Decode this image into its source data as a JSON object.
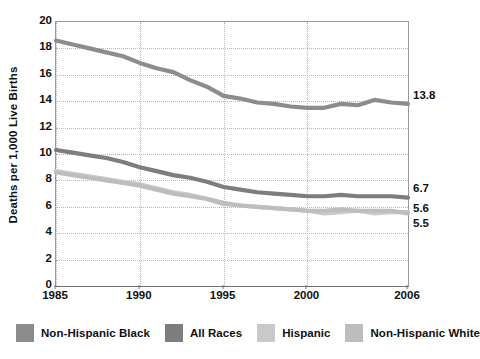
{
  "chart_data": {
    "type": "line",
    "title": "",
    "xlabel": "",
    "ylabel": "Deaths per 1,000 Live Births",
    "xlim": [
      1985,
      2006
    ],
    "ylim": [
      0,
      20
    ],
    "grid": true,
    "legend_position": "bottom",
    "x_ticks": [
      "1985",
      "1990",
      "1995",
      "2000",
      "2006"
    ],
    "x_tick_values": [
      1985,
      1990,
      1995,
      2000,
      2006
    ],
    "y_ticks": [
      "0",
      "2",
      "4",
      "6",
      "8",
      "10",
      "12",
      "14",
      "16",
      "18",
      "20"
    ],
    "y_tick_values": [
      0,
      2,
      4,
      6,
      8,
      10,
      12,
      14,
      16,
      18,
      20
    ],
    "x": [
      1985,
      1986,
      1987,
      1988,
      1989,
      1990,
      1991,
      1992,
      1993,
      1994,
      1995,
      1996,
      1997,
      1998,
      1999,
      2000,
      2001,
      2002,
      2003,
      2004,
      2005,
      2006
    ],
    "series": [
      {
        "name": "Non-Hispanic Black",
        "color": "#8c8c8c",
        "values": [
          18.6,
          18.3,
          18.0,
          17.7,
          17.4,
          16.9,
          16.5,
          16.2,
          15.6,
          15.1,
          14.4,
          14.2,
          13.9,
          13.8,
          13.6,
          13.5,
          13.5,
          13.8,
          13.7,
          14.1,
          13.9,
          13.8
        ],
        "end_label": "13.8"
      },
      {
        "name": "All Races",
        "color": "#7d7d7d",
        "values": [
          10.3,
          10.1,
          9.9,
          9.7,
          9.4,
          9.0,
          8.7,
          8.4,
          8.2,
          7.9,
          7.5,
          7.3,
          7.1,
          7.0,
          6.9,
          6.8,
          6.8,
          6.9,
          6.8,
          6.8,
          6.8,
          6.7
        ],
        "end_label": "6.7"
      },
      {
        "name": "Hispanic",
        "color": "#c9c9c9",
        "values": [
          8.7,
          8.5,
          8.3,
          8.1,
          7.9,
          7.7,
          7.4,
          7.1,
          6.9,
          6.6,
          6.2,
          6.1,
          6.0,
          5.9,
          5.8,
          5.7,
          5.5,
          5.6,
          5.7,
          5.5,
          5.6,
          5.6
        ],
        "end_label": "5.6"
      },
      {
        "name": "Non-Hispanic White",
        "color": "#bdbdbd",
        "values": [
          8.6,
          8.4,
          8.2,
          8.0,
          7.8,
          7.6,
          7.3,
          7.0,
          6.8,
          6.6,
          6.3,
          6.1,
          6.0,
          5.9,
          5.8,
          5.7,
          5.7,
          5.8,
          5.7,
          5.7,
          5.7,
          5.5
        ],
        "end_label": "5.5"
      }
    ],
    "annotations": [
      {
        "text": "13.8",
        "x": 2006,
        "y": 14.3
      },
      {
        "text": "6.7",
        "x": 2006,
        "y": 7.3
      },
      {
        "text": "5.6",
        "x": 2006,
        "y": 5.75
      },
      {
        "text": "5.5",
        "x": 2006,
        "y": 4.6
      }
    ]
  },
  "legend": {
    "items": [
      {
        "label": "Non-Hispanic Black",
        "color": "#8c8c8c"
      },
      {
        "label": "All Races",
        "color": "#7d7d7d"
      },
      {
        "label": "Hispanic",
        "color": "#c9c9c9"
      },
      {
        "label": "Non-Hispanic White",
        "color": "#bdbdbd"
      }
    ]
  },
  "axes": {
    "y_title": "Deaths per 1,000 Live Births"
  }
}
